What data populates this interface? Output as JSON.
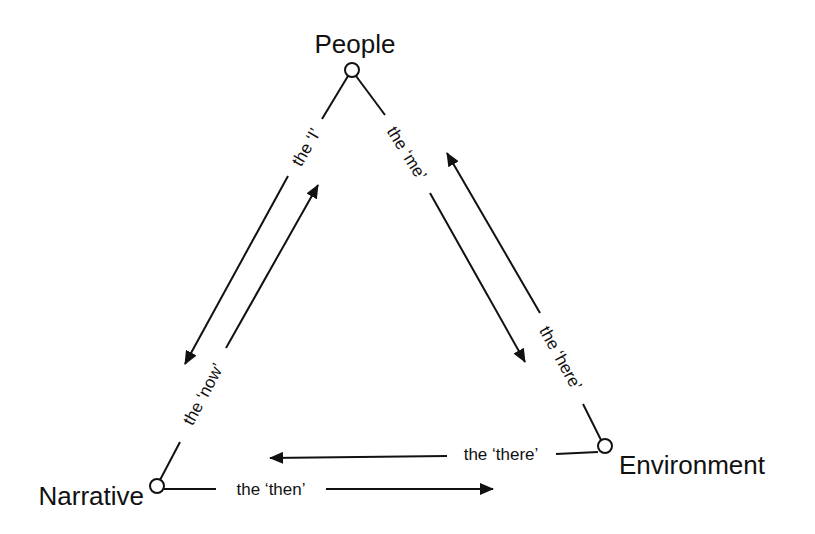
{
  "diagram": {
    "type": "triangle-relationship",
    "nodes": [
      {
        "id": "people",
        "label": "People"
      },
      {
        "id": "narrative",
        "label": "Narrative"
      },
      {
        "id": "environment",
        "label": "Environment"
      }
    ],
    "edges": [
      {
        "id": "i",
        "label": "the ‘I’",
        "from": "people",
        "to": "narrative"
      },
      {
        "id": "now",
        "label": "the ‘now’",
        "from": "narrative",
        "to": "people"
      },
      {
        "id": "me",
        "label": "the ‘me’",
        "from": "people",
        "to": "environment"
      },
      {
        "id": "here",
        "label": "the ‘here’",
        "from": "environment",
        "to": "people"
      },
      {
        "id": "there",
        "label": "the ‘there’",
        "from": "environment",
        "to": "narrative"
      },
      {
        "id": "then",
        "label": "the ‘then’",
        "from": "narrative",
        "to": "environment"
      }
    ],
    "colors": {
      "stroke": "#111111",
      "background": "#ffffff"
    }
  }
}
